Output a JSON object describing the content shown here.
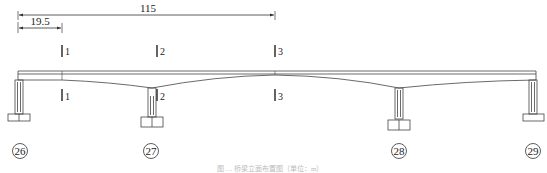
{
  "diagram": {
    "type": "bridge-elevation",
    "dimensions": [
      {
        "id": "overall",
        "label": "115",
        "from_x": 18,
        "to_x": 275
      },
      {
        "id": "side-span-segment",
        "label": "19.5",
        "from_x": 18,
        "to_x": 62
      }
    ],
    "sections": [
      {
        "id": "1",
        "label": "1",
        "x": 62
      },
      {
        "id": "2",
        "label": "2",
        "x": 157
      },
      {
        "id": "3",
        "label": "3",
        "x": 275
      }
    ],
    "piers": [
      {
        "id": "26",
        "label": "26",
        "x": 19
      },
      {
        "id": "27",
        "label": "27",
        "x": 152
      },
      {
        "id": "28",
        "label": "28",
        "x": 399
      },
      {
        "id": "29",
        "label": "29",
        "x": 533
      }
    ],
    "caption": "图 … 桥梁立面布置图（单位：m）",
    "colors": {
      "line": "#444444",
      "text": "#222222",
      "caption": "#bbbbbb"
    }
  }
}
